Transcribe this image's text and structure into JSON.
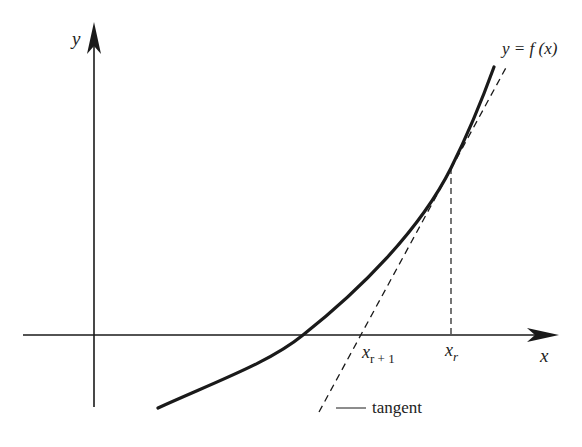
{
  "diagram": {
    "axes": {
      "x_label": "x",
      "y_label": "y"
    },
    "curve_label": "y = f (x)",
    "points": {
      "x_r": {
        "base": "x",
        "sub": "r"
      },
      "x_r1": {
        "base": "x",
        "sub": "r + 1"
      }
    },
    "tangent_label": "tangent",
    "colors": {
      "stroke": "#1a1a1a",
      "background": "#ffffff"
    }
  }
}
